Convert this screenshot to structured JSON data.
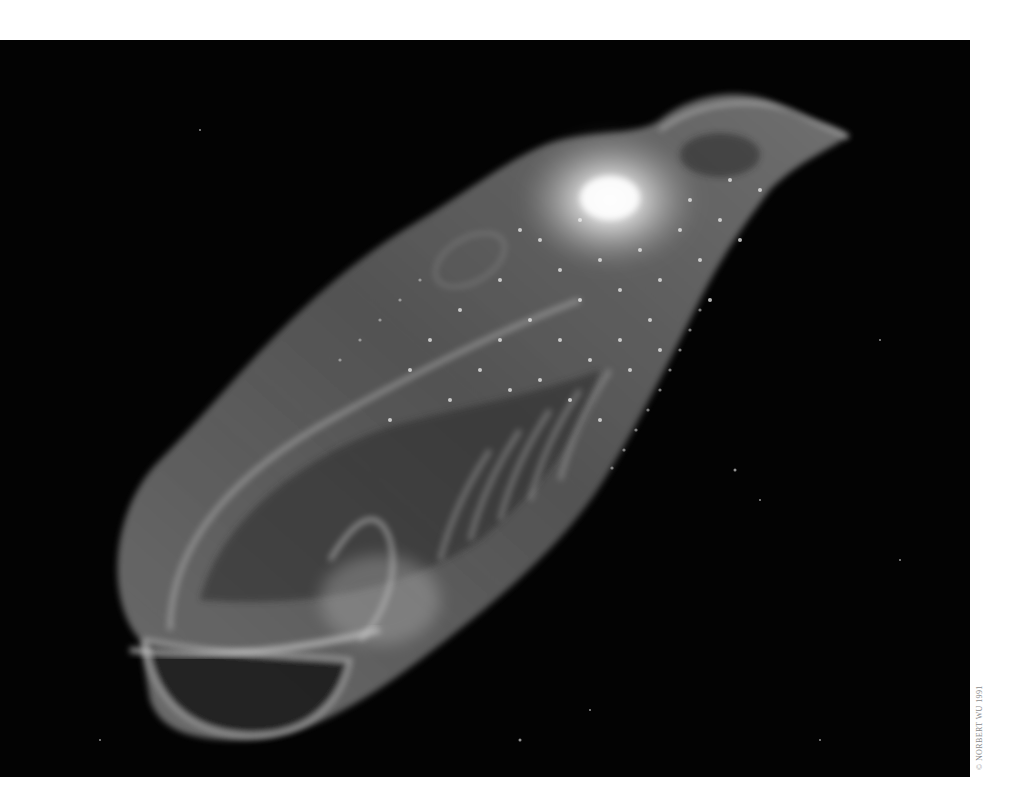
{
  "photo": {
    "subject": "translucent gelatinous marine organism (salp / ctenophore) glowing against black water",
    "background_color": "#030303",
    "page_color": "#ffffff",
    "body_tint": "#bdbdbd",
    "highlight_color": "#ffffff"
  },
  "credit": {
    "text": "© NORBERT WU 1991",
    "color": "#8a8a8a"
  }
}
